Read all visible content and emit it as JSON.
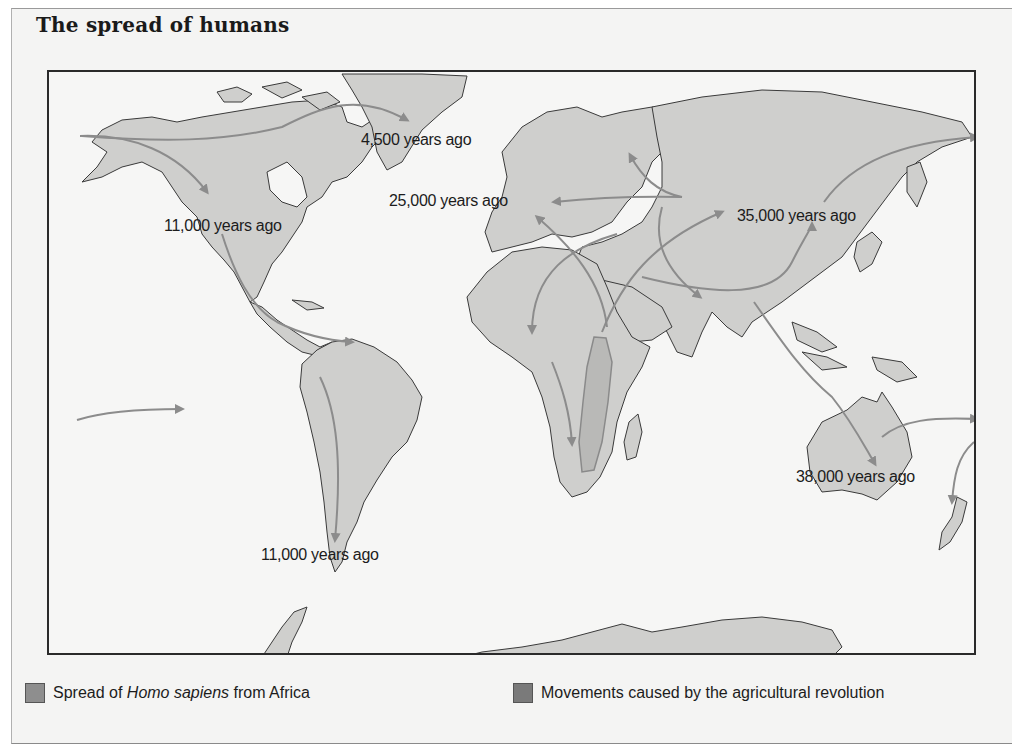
{
  "figure": {
    "title": "The spread of humans"
  },
  "map": {
    "land_color": "#cfcfcd",
    "ocean_color": "#f6f6f5",
    "arrow_color": "#8c8c8c",
    "coast_color": "#3a3a3a",
    "agri_region_color": "#b9b9b7",
    "labels": [
      {
        "id": "greenland",
        "text": "4,500 years ago"
      },
      {
        "id": "north-america",
        "text": "11,000 years ago"
      },
      {
        "id": "europe",
        "text": "25,000 years ago"
      },
      {
        "id": "east-asia",
        "text": "35,000 years ago"
      },
      {
        "id": "australia",
        "text": "38,000 years ago"
      },
      {
        "id": "south-america",
        "text": "11,000 years ago"
      }
    ]
  },
  "legend": {
    "items": [
      {
        "prefix": "Spread of ",
        "italic": "Homo sapiens",
        "suffix": " from Africa",
        "color": "#8e8e8e"
      },
      {
        "prefix": "Movements caused by the agricultural revolution",
        "italic": "",
        "suffix": "",
        "color": "#7a7a7a"
      }
    ]
  }
}
